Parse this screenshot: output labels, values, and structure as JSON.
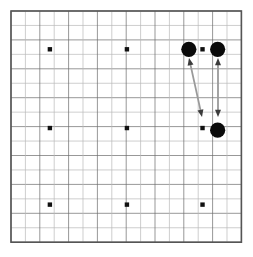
{
  "figure": {
    "kind": "go-board-diagram",
    "title": "",
    "caption": "",
    "board": {
      "columns": 16,
      "rows": 16,
      "line_count_h": 17,
      "line_count_v": 17,
      "origin_x": 11,
      "origin_y": 11,
      "cell_width": 14.4,
      "cell_height": 14.45,
      "border_color": "#555555",
      "grid_color": "#6b6b6b",
      "grid_color_light": "#b9b9b9",
      "background_color": "#ffffff",
      "border_width": 1.6,
      "grid_width": 0.7
    },
    "star_points": {
      "label": "hoshi",
      "radius": 2.2,
      "color": "#111111",
      "points": [
        {
          "name": "star-point-top-left",
          "col": 2.7,
          "row": 2.65
        },
        {
          "name": "star-point-top-center",
          "col": 8.05,
          "row": 2.65
        },
        {
          "name": "star-point-top-right",
          "col": 13.3,
          "row": 2.65
        },
        {
          "name": "star-point-middle-left",
          "col": 2.7,
          "row": 8.1
        },
        {
          "name": "star-point-center",
          "col": 8.05,
          "row": 8.1
        },
        {
          "name": "star-point-middle-right",
          "col": 13.3,
          "row": 8.1
        },
        {
          "name": "star-point-bottom-left",
          "col": 2.7,
          "row": 13.4
        },
        {
          "name": "star-point-bottom-center",
          "col": 8.05,
          "row": 13.4
        },
        {
          "name": "star-point-bottom-right",
          "col": 13.3,
          "row": 13.4
        }
      ]
    },
    "stones": {
      "radius": 7.6,
      "black_color": "#0a0a0a",
      "white_color": "#ffffff",
      "items": [
        {
          "name": "black-stone-upper-left",
          "col": 12.35,
          "row": 2.65,
          "color": "black"
        },
        {
          "name": "black-stone-upper-right",
          "col": 14.35,
          "row": 2.65,
          "color": "black"
        },
        {
          "name": "black-stone-lower-right",
          "col": 14.35,
          "row": 8.25,
          "color": "black"
        }
      ]
    },
    "arrows": {
      "shaft_color": "#9a9a9a",
      "head_color": "#3b3b3b",
      "shaft_width": 1.8,
      "items": [
        {
          "name": "arrow-diagonal-double",
          "double_headed": true,
          "from_x": 189,
          "from_y": 58,
          "to_x": 202,
          "to_y": 117
        },
        {
          "name": "arrow-vertical-double",
          "double_headed": true,
          "from_x": 218,
          "from_y": 58,
          "to_x": 218,
          "to_y": 117
        }
      ]
    }
  }
}
